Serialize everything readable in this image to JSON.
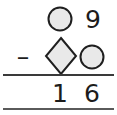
{
  "problem": {
    "type": "vertical-subtraction",
    "operator": "–",
    "minuend": {
      "tens": {
        "kind": "shape",
        "shape": "circle",
        "label": "circle"
      },
      "ones": {
        "kind": "digit",
        "value": "9"
      }
    },
    "subtrahend": {
      "tens": {
        "kind": "shape",
        "shape": "diamond",
        "label": "diamond"
      },
      "ones": {
        "kind": "shape",
        "shape": "circle",
        "label": "circle"
      }
    },
    "difference": {
      "tens": {
        "kind": "digit",
        "value": "1"
      },
      "ones": {
        "kind": "digit",
        "value": "6"
      }
    }
  },
  "colors": {
    "background": "#ffffff",
    "ink": "#1c1c1c",
    "shape_fill": "#e9e9e9",
    "shape_stroke": "#1f1f1f",
    "rule": "#3a3a3a"
  },
  "icons": {
    "circle": "circle-shape-icon",
    "diamond": "diamond-shape-icon",
    "minus": "minus-operator-icon"
  }
}
